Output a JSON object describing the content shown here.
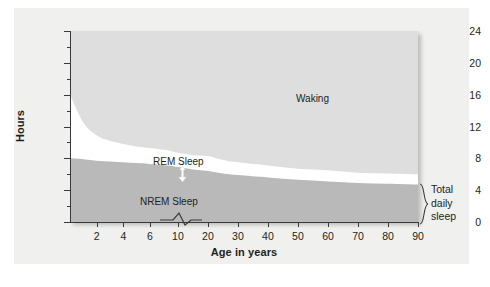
{
  "chart_data": {
    "type": "area",
    "title": "",
    "xlabel": "Age in years",
    "ylabel": "Hours",
    "ylim": [
      0,
      24
    ],
    "y_ticks": [
      0,
      4,
      8,
      12,
      16,
      20,
      24
    ],
    "y_minor_ticks": [
      2,
      6,
      10,
      14,
      18,
      22
    ],
    "x_tick_labels": [
      "2",
      "4",
      "6",
      "10",
      "20",
      "30",
      "40",
      "50",
      "60",
      "70",
      "80",
      "90"
    ],
    "x_axis_break": true,
    "grid": "vertical",
    "legend": "inline-labels",
    "stacking": "stacked-from-bottom",
    "annotations": [
      {
        "name": "waking",
        "text": "Waking"
      },
      {
        "name": "rem",
        "text": "REM Sleep"
      },
      {
        "name": "nrem",
        "text": "NREM Sleep"
      },
      {
        "name": "total-daily-sleep",
        "text": "Total\ndaily\nsleep"
      }
    ],
    "series": [
      {
        "name": "NREM Sleep",
        "color": "#b9b9b9",
        "x": [
          0,
          1,
          2,
          3,
          4,
          5,
          6,
          8,
          10,
          15,
          20,
          25,
          30,
          40,
          50,
          60,
          70,
          80,
          90
        ],
        "values": [
          8.0,
          7.9,
          7.7,
          7.6,
          7.5,
          7.4,
          7.3,
          7.1,
          6.9,
          6.6,
          6.4,
          6.1,
          5.9,
          5.6,
          5.3,
          5.1,
          4.9,
          4.8,
          4.7
        ]
      },
      {
        "name": "REM Sleep",
        "color": "#ffffff",
        "x": [
          0,
          1,
          2,
          3,
          4,
          5,
          6,
          8,
          10,
          15,
          20,
          25,
          30,
          40,
          50,
          60,
          70,
          80,
          90
        ],
        "values": [
          8.0,
          4.6,
          3.2,
          2.6,
          2.3,
          2.1,
          2.0,
          1.9,
          1.8,
          1.8,
          1.9,
          1.7,
          1.6,
          1.5,
          1.4,
          1.4,
          1.3,
          1.3,
          1.3
        ]
      },
      {
        "name": "Waking",
        "color": "#dedede",
        "x": [
          0,
          1,
          2,
          3,
          4,
          5,
          6,
          8,
          10,
          15,
          20,
          25,
          30,
          40,
          50,
          60,
          70,
          80,
          90
        ],
        "values": [
          8.0,
          11.5,
          13.1,
          13.8,
          14.2,
          14.5,
          14.7,
          15.0,
          15.3,
          15.6,
          15.7,
          16.2,
          16.5,
          16.9,
          17.3,
          17.5,
          17.8,
          17.9,
          18.0
        ]
      }
    ],
    "total_daily_sleep_bracket": {
      "from_hours": 0,
      "to_hours": 6.0
    }
  },
  "colors": {
    "waking": "#dedede",
    "rem": "#ffffff",
    "nrem": "#b9b9b9",
    "axis": "#3a3a3a",
    "gridline": "#c9c9c9",
    "text": "#231f20",
    "card_background": "#f0f0ef"
  }
}
